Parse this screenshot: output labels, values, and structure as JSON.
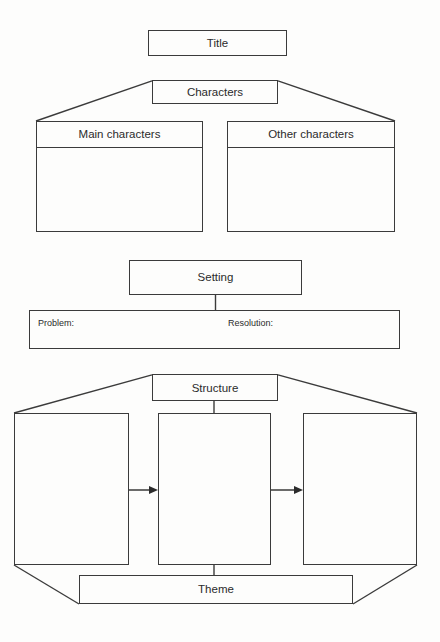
{
  "diagram": {
    "type": "story-map-graphic-organizer",
    "ink_color": "#3b3b3b",
    "text_color": "#2b2b2b",
    "background_color": "#fdfdfc"
  },
  "title_box": {
    "label": "Title"
  },
  "characters": {
    "header_label": "Characters",
    "branches": [
      {
        "label": "Main characters"
      },
      {
        "label": "Other characters"
      }
    ]
  },
  "setting": {
    "header_label": "Setting",
    "fields": [
      {
        "label": "Problem:"
      },
      {
        "label": "Resolution:"
      }
    ]
  },
  "structure": {
    "header_label": "Structure",
    "stages": [
      {
        "label": ""
      },
      {
        "label": ""
      },
      {
        "label": ""
      }
    ],
    "arrows": [
      {
        "name": "arrow-stage1-to-stage2"
      },
      {
        "name": "arrow-stage2-to-stage3"
      }
    ]
  },
  "theme": {
    "label": "Theme"
  }
}
